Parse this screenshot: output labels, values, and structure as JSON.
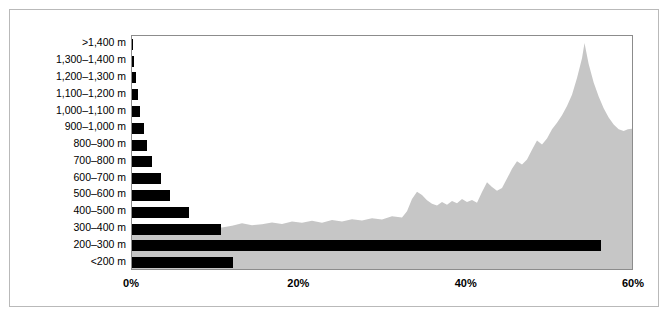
{
  "chart_data": {
    "type": "bar",
    "orientation": "horizontal",
    "title": "",
    "subtitle": "",
    "xlabel": "",
    "ylabel": "",
    "xlim": [
      0,
      60
    ],
    "ylim": null,
    "grid": false,
    "legend": null,
    "categories": [
      ">1,400 m",
      "1,300–1,400 m",
      "1,200–1,300 m",
      "1,100–1,200 m",
      "1,000–1,100 m",
      "900–1,000 m",
      "800–900 m",
      "700–800 m",
      "600–700 m",
      "500–600 m",
      "400–500 m",
      "300–400 m",
      "200–300 m",
      "<200 m"
    ],
    "values": [
      0.1,
      0.2,
      0.5,
      0.7,
      1.0,
      1.4,
      1.8,
      2.4,
      3.5,
      4.5,
      6.8,
      10.6,
      56.0,
      12.1
    ],
    "value_unit": "%",
    "xticks": [
      0,
      20,
      40,
      60
    ],
    "xticklabels": [
      "0%",
      "20%",
      "40%",
      "60%"
    ],
    "bar_color": "#000000",
    "background_silhouette": {
      "description": "mountain-profile silhouette behind bars",
      "color": "#c6c6c6",
      "peak_x_percent": 54.3,
      "peak_height_fraction": 0.97,
      "profile_points": [
        [
          0.0,
          0.175
        ],
        [
          1.2,
          0.178
        ],
        [
          2.4,
          0.172
        ],
        [
          3.6,
          0.18
        ],
        [
          4.8,
          0.186
        ],
        [
          6.0,
          0.176
        ],
        [
          7.2,
          0.183
        ],
        [
          8.4,
          0.19
        ],
        [
          9.6,
          0.182
        ],
        [
          10.8,
          0.178
        ],
        [
          12.0,
          0.186
        ],
        [
          13.2,
          0.196
        ],
        [
          14.4,
          0.188
        ],
        [
          15.6,
          0.192
        ],
        [
          16.8,
          0.2
        ],
        [
          18.0,
          0.193
        ],
        [
          19.2,
          0.204
        ],
        [
          20.4,
          0.198
        ],
        [
          21.6,
          0.207
        ],
        [
          22.8,
          0.199
        ],
        [
          24.0,
          0.21
        ],
        [
          25.2,
          0.204
        ],
        [
          26.4,
          0.214
        ],
        [
          27.6,
          0.208
        ],
        [
          28.8,
          0.218
        ],
        [
          30.0,
          0.212
        ],
        [
          31.2,
          0.226
        ],
        [
          32.4,
          0.221
        ],
        [
          33.0,
          0.248
        ],
        [
          33.6,
          0.3
        ],
        [
          34.2,
          0.332
        ],
        [
          34.8,
          0.318
        ],
        [
          35.4,
          0.295
        ],
        [
          36.0,
          0.28
        ],
        [
          36.6,
          0.272
        ],
        [
          37.2,
          0.288
        ],
        [
          37.8,
          0.276
        ],
        [
          38.4,
          0.292
        ],
        [
          39.0,
          0.282
        ],
        [
          39.6,
          0.3
        ],
        [
          40.2,
          0.288
        ],
        [
          40.8,
          0.296
        ],
        [
          41.4,
          0.284
        ],
        [
          42.0,
          0.33
        ],
        [
          42.6,
          0.372
        ],
        [
          43.2,
          0.352
        ],
        [
          43.8,
          0.336
        ],
        [
          44.4,
          0.348
        ],
        [
          45.0,
          0.388
        ],
        [
          45.6,
          0.43
        ],
        [
          46.2,
          0.462
        ],
        [
          46.8,
          0.448
        ],
        [
          47.4,
          0.47
        ],
        [
          48.0,
          0.512
        ],
        [
          48.6,
          0.552
        ],
        [
          49.2,
          0.534
        ],
        [
          49.8,
          0.56
        ],
        [
          50.4,
          0.6
        ],
        [
          51.0,
          0.628
        ],
        [
          51.6,
          0.66
        ],
        [
          52.2,
          0.7
        ],
        [
          52.8,
          0.748
        ],
        [
          53.4,
          0.82
        ],
        [
          54.0,
          0.905
        ],
        [
          54.3,
          0.97
        ],
        [
          54.8,
          0.88
        ],
        [
          55.4,
          0.8
        ],
        [
          56.0,
          0.74
        ],
        [
          56.6,
          0.69
        ],
        [
          57.2,
          0.65
        ],
        [
          57.8,
          0.62
        ],
        [
          58.4,
          0.6
        ],
        [
          59.0,
          0.592
        ],
        [
          59.5,
          0.6
        ],
        [
          60.0,
          0.602
        ]
      ]
    }
  },
  "colors": {
    "bar": "#000000",
    "silhouette": "#c6c6c6",
    "plot_border": "#8c8c8c",
    "outer_frame": "#b9b9b9",
    "background": "#ffffff",
    "text": "#000000"
  }
}
